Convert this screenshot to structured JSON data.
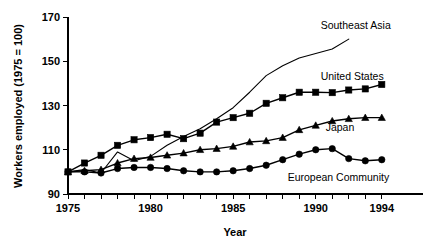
{
  "chart_data": {
    "type": "line",
    "title": "",
    "xlabel": "Year",
    "ylabel": "Workers employed (1975 = 100)",
    "xlim": [
      1975,
      1994.8
    ],
    "ylim": [
      90,
      170
    ],
    "xticks": [
      1975,
      1976,
      1977,
      1978,
      1979,
      1980,
      1981,
      1982,
      1983,
      1984,
      1985,
      1986,
      1987,
      1988,
      1989,
      1990,
      1991,
      1992,
      1993,
      1994
    ],
    "xtick_labels": [
      "1975",
      "",
      "",
      "",
      "",
      "1980",
      "",
      "",
      "",
      "",
      "1985",
      "",
      "",
      "",
      "",
      "1990",
      "",
      "",
      "",
      "1994"
    ],
    "yticks": [
      90,
      110,
      130,
      150,
      170
    ],
    "ytick_labels": [
      "90",
      "110",
      "130",
      "150",
      "170"
    ],
    "grid": false,
    "legend_position": "inline-right",
    "series": [
      {
        "name": "Southeast Asia",
        "marker": "none",
        "label_x": 1990.3,
        "label_y": 166.5,
        "x": [
          1975,
          1976,
          1977,
          1978,
          1979,
          1980,
          1981,
          1982,
          1983,
          1984,
          1985,
          1986,
          1987,
          1988,
          1989,
          1990,
          1991,
          1992
        ],
        "values": [
          100,
          101,
          99.5,
          109,
          105,
          107,
          112,
          116,
          119.5,
          124,
          129,
          136,
          143.5,
          148,
          151.5,
          153.5,
          155.5,
          160
        ]
      },
      {
        "name": "United States",
        "marker": "square",
        "label_x": 1990.3,
        "label_y": 143.5,
        "x": [
          1975,
          1976,
          1977,
          1978,
          1979,
          1980,
          1981,
          1982,
          1983,
          1984,
          1985,
          1986,
          1987,
          1988,
          1989,
          1990,
          1991,
          1992,
          1993,
          1994
        ],
        "values": [
          100,
          104,
          107.5,
          112,
          114.5,
          115.5,
          117,
          115,
          117.5,
          122.5,
          124.5,
          126.5,
          131,
          133.5,
          136,
          136,
          135.8,
          137,
          137.5,
          139.5
        ]
      },
      {
        "name": "Japan",
        "marker": "triangle",
        "label_x": 1990.6,
        "label_y": 120.5,
        "x": [
          1975,
          1976,
          1977,
          1978,
          1979,
          1980,
          1981,
          1982,
          1983,
          1984,
          1985,
          1986,
          1987,
          1988,
          1989,
          1990,
          1991,
          1992,
          1993,
          1994
        ],
        "values": [
          100,
          100.5,
          101,
          104,
          106,
          106.5,
          107.5,
          108.5,
          110,
          110.5,
          111.5,
          113.5,
          114,
          115.5,
          119,
          121,
          123,
          124,
          124.5,
          124.5
        ]
      },
      {
        "name": "European Community",
        "marker": "circle",
        "label_x": 1988.3,
        "label_y": 97.5,
        "x": [
          1975,
          1976,
          1977,
          1978,
          1979,
          1980,
          1981,
          1982,
          1983,
          1984,
          1985,
          1986,
          1987,
          1988,
          1989,
          1990,
          1991,
          1992,
          1993,
          1994
        ],
        "values": [
          100,
          100,
          99.5,
          101.5,
          102,
          102,
          101.5,
          100.5,
          100,
          100,
          100.5,
          101.5,
          103,
          105.5,
          108,
          110,
          110.5,
          106,
          105,
          105.5
        ]
      }
    ]
  }
}
